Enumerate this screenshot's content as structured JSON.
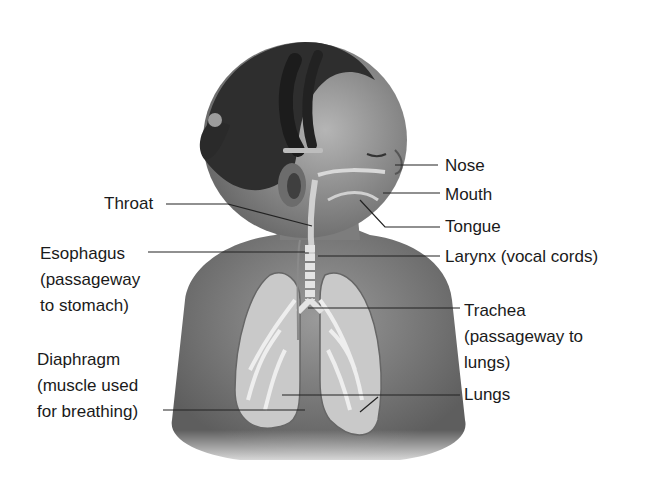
{
  "diagram": {
    "labels_left": [
      {
        "id": "throat",
        "lines": [
          "Throat"
        ]
      },
      {
        "id": "esophagus",
        "lines": [
          "Esophagus",
          "(passageway",
          "to stomach)"
        ]
      },
      {
        "id": "diaphragm",
        "lines": [
          "Diaphragm",
          "(muscle used",
          "for breathing)"
        ]
      }
    ],
    "labels_right": [
      {
        "id": "nose",
        "lines": [
          "Nose"
        ]
      },
      {
        "id": "mouth",
        "lines": [
          "Mouth"
        ]
      },
      {
        "id": "tongue",
        "lines": [
          "Tongue"
        ]
      },
      {
        "id": "larynx",
        "lines": [
          "Larynx (vocal cords)"
        ]
      },
      {
        "id": "trachea",
        "lines": [
          "Trachea",
          "(passageway to",
          "lungs)"
        ]
      },
      {
        "id": "lungs",
        "lines": [
          "Lungs"
        ]
      }
    ]
  }
}
